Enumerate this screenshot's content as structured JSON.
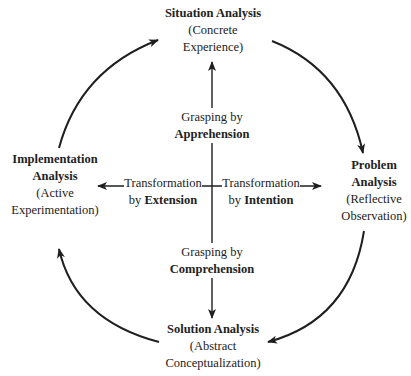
{
  "nodes": {
    "top": {
      "title": "Situation Analysis",
      "subtitle_line1": "(Concrete",
      "subtitle_line2": "Experience)"
    },
    "right": {
      "title_line1": "Problem",
      "title_line2": "Analysis",
      "subtitle_line1": "(Reflective",
      "subtitle_line2": "Observation)"
    },
    "bottom": {
      "title": "Solution Analysis",
      "subtitle_line1": "(Abstract",
      "subtitle_line2": "Conceptualization)"
    },
    "left": {
      "title_line1": "Implementation",
      "title_line2": "Analysis",
      "subtitle_line1": "(Active",
      "subtitle_line2": "Experimentation)"
    }
  },
  "axes": {
    "up": {
      "line1": "Grasping by",
      "line2_bold": "Apprehension"
    },
    "down": {
      "line1": "Grasping by",
      "line2_bold": "Comprehension"
    },
    "left": {
      "line1": "Transformation",
      "line2_prefix": "by ",
      "line2_bold": "Extension"
    },
    "right": {
      "line1": "Transformation",
      "line2_prefix": "by ",
      "line2_bold": "Intention"
    }
  },
  "colors": {
    "stroke": "#1f1f1f",
    "background": "#ffffff"
  }
}
